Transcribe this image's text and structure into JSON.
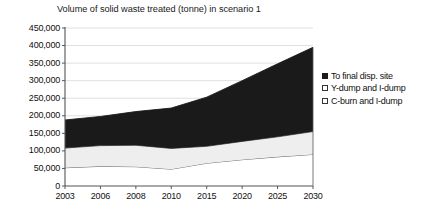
{
  "chart_data": {
    "type": "area",
    "stacked": true,
    "title": "Volume of solid waste treated (tonne) in scenario 1",
    "xlabel": "",
    "ylabel": "",
    "categories": [
      "2003",
      "2006",
      "2008",
      "2010",
      "2015",
      "2020",
      "2025",
      "2030"
    ],
    "x_ticklabels": [
      "2003",
      "2006",
      "2008",
      "2010",
      "2015",
      "2020",
      "2025",
      "2030"
    ],
    "y_ticklabels": [
      "0",
      "50,000",
      "100,000",
      "150,000",
      "200,000",
      "250,000",
      "300,000",
      "350,000",
      "400,000",
      "450,000"
    ],
    "y_tickvalues": [
      0,
      50000,
      100000,
      150000,
      200000,
      250000,
      300000,
      350000,
      400000,
      450000
    ],
    "ylim": [
      0,
      450000
    ],
    "grid": "horizontal",
    "legend_position": "right",
    "series": [
      {
        "name": "C-burn and I-dump",
        "order": "bottom",
        "color": "#ffffff",
        "edge": "#555555",
        "values": [
          52000,
          56000,
          55000,
          48000,
          65000,
          75000,
          83000,
          90000
        ]
      },
      {
        "name": "Y-dump and I-dump",
        "order": "middle",
        "color": "#eeeeee",
        "edge": "#555555",
        "values": [
          56000,
          59000,
          61000,
          59000,
          48000,
          52000,
          57000,
          65000
        ]
      },
      {
        "name": "To final disp. site",
        "order": "top",
        "color": "#1a1a1a",
        "edge": "#1a1a1a",
        "values": [
          80000,
          83000,
          96000,
          115000,
          140000,
          173000,
          208000,
          240000
        ]
      }
    ],
    "cumulative_tops": {
      "C-burn and I-dump": [
        52000,
        56000,
        55000,
        48000,
        65000,
        75000,
        83000,
        90000
      ],
      "Y-dump and I-dump": [
        108000,
        115000,
        116000,
        107000,
        113000,
        127000,
        140000,
        155000
      ],
      "To final disp. site": [
        188000,
        198000,
        212000,
        222000,
        253000,
        300000,
        348000,
        395000
      ]
    }
  },
  "legend": {
    "items": [
      {
        "label": "To final disp. site",
        "swatch": "#1a1a1a",
        "border": "#1a1a1a"
      },
      {
        "label": "Y-dump and I-dump",
        "swatch": "#ffffff",
        "border": "#333333"
      },
      {
        "label": "C-burn and I-dump",
        "swatch": "#ffffff",
        "border": "#333333"
      }
    ]
  },
  "axes": {
    "y_labels": [
      "450,000",
      "400,000",
      "350,000",
      "300,000",
      "250,000",
      "200,000",
      "150,000",
      "100,000",
      "50,000",
      "0"
    ],
    "x_labels": [
      "2003",
      "2006",
      "2008",
      "2010",
      "2015",
      "2020",
      "2025",
      "2030"
    ]
  }
}
